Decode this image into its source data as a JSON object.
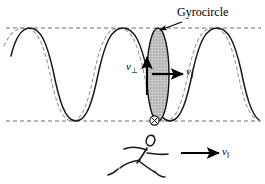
{
  "figure": {
    "caption_label": "Gyrocircle",
    "labels": {
      "gyrocircle": "Gyrocircle",
      "v_perp_symbol": "v",
      "v_perp_subscript": "⊥",
      "v_par_symbol": "v",
      "v_par_subscript": "‖",
      "v_par_runner_symbol": "v",
      "v_par_runner_subscript": "‖"
    },
    "colors": {
      "background": "#ffffff",
      "solid_wave": "#1a1a1a",
      "dashed_wave": "#8c8c8c",
      "guide_line": "#6e6e6e",
      "ellipse_fill": "#b3b3b3",
      "ellipse_stroke": "#111111",
      "arrow": "#000000",
      "stick_figure": "#1a1a1a",
      "text": "#000000"
    },
    "geometry": {
      "width": 265,
      "height": 184,
      "top_guide_y": 28,
      "bottom_guide_y": 121,
      "ellipse_center_x": 158,
      "ellipse_center_y": 74,
      "ellipse_rx": 11,
      "ellipse_ry": 47,
      "wavelength": 95,
      "solid_wave_phase_offset": 0,
      "dashed_wave_phase_offset": -22
    },
    "elements": {
      "solid_wave_name": "solid-trajectory-wave",
      "dashed_wave_name": "dashed-trajectory-wave",
      "top_guide_name": "top-guide-line",
      "bottom_guide_name": "bottom-guide-line",
      "ellipse_name": "gyrocircle-ellipse",
      "leader_name": "gyrocircle-leader-line",
      "v_perp_arrow_name": "v-perpendicular-arrow",
      "v_par_arrow_name": "v-parallel-arrow",
      "cross_circle_name": "field-out-of-page-symbol",
      "runner_name": "running-stick-figure",
      "runner_arrow_name": "runner-velocity-arrow"
    }
  }
}
